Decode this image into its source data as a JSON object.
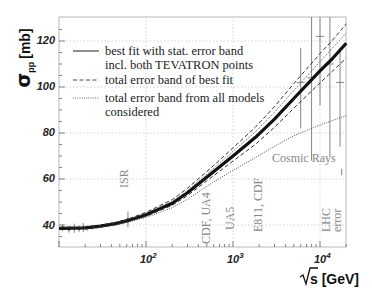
{
  "chart_data": {
    "type": "line",
    "title": "",
    "xlabel": "√s [GeV]",
    "ylabel": "σ_pp [mb]",
    "xscale": "log",
    "xlim": [
      10,
      20000
    ],
    "ylim": [
      30,
      130
    ],
    "xticks": [
      {
        "value": 100,
        "label": "10",
        "exp": "2"
      },
      {
        "value": 1000,
        "label": "10",
        "exp": "3"
      },
      {
        "value": 10000,
        "label": "10",
        "exp": "4"
      }
    ],
    "yticks": [
      40,
      60,
      80,
      100,
      120
    ],
    "grid": true,
    "legend_position": "upper-left",
    "legend": [
      {
        "style": "solid",
        "text_lines": [
          "best fit with stat. error band",
          "incl. both TEVATRON points"
        ]
      },
      {
        "style": "dashed",
        "text_lines": [
          "total error band of best fit"
        ]
      },
      {
        "style": "dotted",
        "text_lines": [
          "total error band from all models",
          "considered"
        ]
      }
    ],
    "x": [
      10,
      20,
      30,
      45,
      60,
      100,
      200,
      300,
      546,
      1000,
      1800,
      3000,
      5000,
      10000,
      14000,
      20000
    ],
    "series": [
      {
        "name": "best fit (stat. error band)",
        "style": "solid-thick",
        "values": [
          38.5,
          38.8,
          39.5,
          40.6,
          41.8,
          44.5,
          49.5,
          54.0,
          62.0,
          70.0,
          78.0,
          86.0,
          95.0,
          107.0,
          112.5,
          119.0
        ]
      },
      {
        "name": "total error band of best fit (upper)",
        "style": "dashed",
        "values": [
          38.6,
          39.0,
          39.8,
          41.0,
          42.4,
          45.5,
          51.0,
          56.0,
          64.5,
          73.5,
          82.5,
          91.5,
          101.5,
          114.5,
          120.5,
          127.5
        ]
      },
      {
        "name": "total error band of best fit (lower)",
        "style": "dashed",
        "values": [
          38.4,
          38.7,
          39.3,
          40.3,
          41.4,
          43.8,
          48.5,
          52.8,
          60.3,
          67.8,
          75.0,
          82.5,
          90.8,
          101.8,
          107.0,
          112.5
        ]
      },
      {
        "name": "total error band from all models (upper)",
        "style": "dotted",
        "values": [
          38.6,
          38.9,
          39.6,
          40.8,
          42.0,
          45.0,
          50.2,
          55.0,
          63.3,
          72.0,
          80.5,
          89.0,
          98.5,
          111.0,
          117.0,
          123.5
        ]
      },
      {
        "name": "total error band from all models (lower)",
        "style": "dotted",
        "values": [
          38.4,
          38.6,
          39.2,
          40.1,
          41.1,
          43.3,
          47.5,
          51.2,
          57.8,
          63.8,
          69.3,
          74.2,
          78.8,
          83.5,
          85.5,
          87.5
        ]
      }
    ],
    "data_points": {
      "low_energy": [
        {
          "x": 11,
          "y": 38.8,
          "err": 1.5
        },
        {
          "x": 13,
          "y": 38.2,
          "err": 1.5
        },
        {
          "x": 15,
          "y": 38.6,
          "err": 2.0
        },
        {
          "x": 17,
          "y": 38.4,
          "err": 1.5
        },
        {
          "x": 19,
          "y": 38.9,
          "err": 2.0
        },
        {
          "x": 21,
          "y": 38.7,
          "err": 1.2
        },
        {
          "x": 24,
          "y": 39.0,
          "err": 1.0
        },
        {
          "x": 27,
          "y": 39.2,
          "err": 0.8
        },
        {
          "x": 31,
          "y": 39.6,
          "err": 0.8
        },
        {
          "x": 35,
          "y": 40.0,
          "err": 0.8
        },
        {
          "x": 40,
          "y": 40.4,
          "err": 0.8
        },
        {
          "x": 45,
          "y": 40.8,
          "err": 0.8
        },
        {
          "x": 53,
          "y": 41.6,
          "err": 0.6
        },
        {
          "x": 62,
          "y": 42.4,
          "err": 3.5
        }
      ],
      "cosmic_rays": [
        {
          "x": 6000,
          "y": 102,
          "err_low": 20,
          "err_high": 15
        },
        {
          "x": 8000,
          "y": 104,
          "err_low": 36,
          "err_high": 36
        },
        {
          "x": 10000,
          "y": 122,
          "err_low": 30,
          "err_high": 25
        },
        {
          "x": 13000,
          "y": 110,
          "err_low": 40,
          "err_high": 40
        },
        {
          "x": 17000,
          "y": 102,
          "err_low": 28,
          "err_high": 15
        }
      ],
      "lhc_error": {
        "x": 14000,
        "y": 63,
        "err": 1.5
      }
    },
    "annotations": [
      {
        "text": "ISR",
        "x": 62,
        "rotation": -90
      },
      {
        "text": "CDF, UA4",
        "x": 546,
        "rotation": -90
      },
      {
        "text": "UA5",
        "x": 900,
        "rotation": -90
      },
      {
        "text": "E811, CDF",
        "x": 1800,
        "rotation": -90
      },
      {
        "text": "LHC",
        "x": 14000,
        "rotation": -90
      },
      {
        "text": "error",
        "x": 17000,
        "rotation": -90
      },
      {
        "text": "Cosmic Rays",
        "x": 5000,
        "y": 75,
        "rotation": 0
      }
    ]
  },
  "labels": {
    "ylabel_main": "σ",
    "ylabel_sub": "pp",
    "ylabel_unit": "[mb]",
    "xlabel_unit": "s [GeV]",
    "ytick_40": "40",
    "ytick_60": "60",
    "ytick_80": "80",
    "ytick_100": "100",
    "ytick_120": "120",
    "xtick_base": "10",
    "xtick_exp_2": "2",
    "xtick_exp_3": "3",
    "xtick_exp_4": "4",
    "legend_1a": "best fit with stat. error band",
    "legend_1b": "incl. both TEVATRON points",
    "legend_2": "total error band of best fit",
    "legend_3a": "total error band from all models",
    "legend_3b": "considered",
    "annot_isr": "ISR",
    "annot_cdf_ua4": "CDF, UA4",
    "annot_ua5": "UA5",
    "annot_e811": "E811, CDF",
    "annot_lhc": "LHC",
    "annot_error": "error",
    "annot_cosmic": "Cosmic Rays"
  },
  "colors": {
    "curve": "#111111",
    "grid": "#c8c8c8",
    "annotation": "#888888",
    "error_bars": "#777777"
  }
}
